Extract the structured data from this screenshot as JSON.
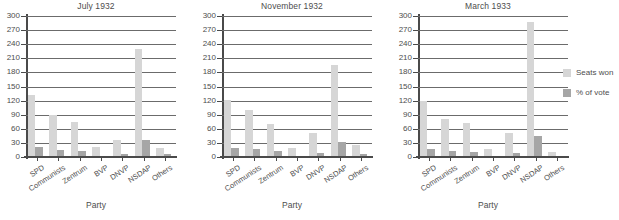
{
  "chart_data": [
    {
      "type": "bar",
      "title": "July 1932",
      "xlabel": "Party",
      "ylabel": "",
      "ylim": [
        0,
        300
      ],
      "yticks": [
        0,
        30,
        60,
        90,
        120,
        150,
        180,
        210,
        240,
        270,
        300
      ],
      "grid": true,
      "legend_position": "right",
      "categories": [
        "SPD",
        "Communists",
        "Zentrum",
        "BVP",
        "DNVP",
        "NSDAP",
        "Others"
      ],
      "series": [
        {
          "name": "Seats won",
          "color": "#d6d6d6",
          "values": [
            133,
            89,
            75,
            22,
            37,
            230,
            19
          ]
        },
        {
          "name": "% of vote",
          "color": "#a6a6a6",
          "values": [
            21,
            14,
            12,
            3,
            6,
            37,
            7
          ]
        }
      ]
    },
    {
      "type": "bar",
      "title": "November 1932",
      "xlabel": "Party",
      "ylabel": "",
      "ylim": [
        0,
        300
      ],
      "yticks": [
        0,
        30,
        60,
        90,
        120,
        150,
        180,
        210,
        240,
        270,
        300
      ],
      "grid": true,
      "legend_position": "right",
      "categories": [
        "SPD",
        "Communists",
        "Zentrum",
        "BVP",
        "DNVP",
        "NSDAP",
        "Others"
      ],
      "series": [
        {
          "name": "Seats won",
          "color": "#d6d6d6",
          "values": [
            121,
            100,
            70,
            20,
            52,
            196,
            25
          ]
        },
        {
          "name": "% of vote",
          "color": "#a6a6a6",
          "values": [
            20,
            17,
            12,
            3,
            9,
            33,
            6
          ]
        }
      ]
    },
    {
      "type": "bar",
      "title": "March 1933",
      "xlabel": "Party",
      "ylabel": "",
      "ylim": [
        0,
        300
      ],
      "yticks": [
        0,
        30,
        60,
        90,
        120,
        150,
        180,
        210,
        240,
        270,
        300
      ],
      "grid": true,
      "legend_position": "right",
      "categories": [
        "SPD",
        "Communists",
        "Zentrum",
        "BVP",
        "DNVP",
        "NSDAP",
        "Others"
      ],
      "series": [
        {
          "name": "Seats won",
          "color": "#d6d6d6",
          "values": [
            120,
            81,
            73,
            18,
            52,
            288,
            11
          ]
        },
        {
          "name": "% of vote",
          "color": "#a6a6a6",
          "values": [
            18,
            12,
            11,
            2,
            8,
            44,
            2
          ]
        }
      ]
    }
  ],
  "legend": {
    "items": [
      {
        "label": "Seats won",
        "color": "#d6d6d6"
      },
      {
        "label": "% of vote",
        "color": "#a6a6a6"
      }
    ]
  }
}
